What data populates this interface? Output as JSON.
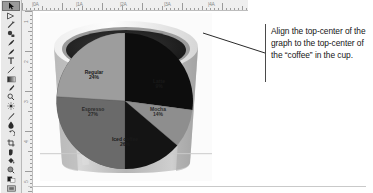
{
  "app": {
    "name": "image-editor",
    "canvas_background": "#ffffff"
  },
  "toolbar": {
    "name": "tools-palette",
    "selected_index": 0,
    "tools": [
      {
        "icon": "move-pointer-icon",
        "label": "Move"
      },
      {
        "icon": "lasso-icon",
        "label": "Lasso"
      },
      {
        "icon": "magic-wand-icon",
        "label": "Magic Wand"
      },
      {
        "icon": "stamp-icon",
        "label": "Clone Stamp"
      },
      {
        "icon": "brush-icon",
        "label": "Brush"
      },
      {
        "icon": "eraser-icon",
        "label": "Eraser"
      },
      {
        "icon": "text-icon",
        "label": "Type"
      },
      {
        "icon": "line-icon",
        "label": "Line"
      },
      {
        "icon": "gradient-icon",
        "label": "Gradient"
      },
      {
        "icon": "eyedropper-icon",
        "label": "Eyedropper"
      },
      {
        "icon": "zoom-icon",
        "label": "Zoom"
      },
      {
        "icon": "sun-icon",
        "label": "Dodge"
      },
      {
        "icon": "pen-icon",
        "label": "Pen"
      },
      {
        "icon": "blur-drop-icon",
        "label": "Blur"
      },
      {
        "icon": "undo-arrow-icon",
        "label": "Undo"
      },
      {
        "icon": "crop-icon",
        "label": "Crop"
      },
      {
        "icon": "hand-icon",
        "label": "Hand"
      },
      {
        "icon": "paint-bucket-icon",
        "label": "Paint Bucket"
      },
      {
        "icon": "search-circle-icon",
        "label": "Zoom Tool"
      },
      {
        "icon": "swatch-icon",
        "label": "Foreground Color"
      },
      {
        "icon": "screen-mode-icon",
        "label": "Screen Mode"
      }
    ]
  },
  "rulers": {
    "horizontal": {
      "name": "horizontal-ruler",
      "labels": [
        "|0A",
        "|1A",
        "|2A",
        "|3A",
        "|4A"
      ]
    },
    "vertical": {
      "name": "vertical-ruler",
      "labels": [
        "1",
        "2",
        "3",
        "4",
        "5"
      ]
    }
  },
  "document": {
    "name": "coffee-cup-document",
    "photo_alt": "coffee-cup-photo"
  },
  "chart_data": {
    "type": "pie",
    "title": "",
    "categories": [
      "Regular",
      "Latte",
      "Mocha",
      "Iced coffee",
      "Espresso"
    ],
    "values": [
      24,
      9,
      14,
      26,
      27
    ],
    "labels_shown": [
      {
        "name": "Regular",
        "pct": "24%",
        "tone": "light"
      },
      {
        "name": "Latte",
        "pct": "9%",
        "tone": "light"
      },
      {
        "name": "Mocha",
        "pct": "14%",
        "tone": "dark"
      },
      {
        "name": "Iced coffee",
        "pct": "26%",
        "tone": "light"
      },
      {
        "name": "Espresso",
        "pct": "27%",
        "tone": "dark"
      }
    ],
    "slice_colors": [
      "#9d9d9d",
      "#8e8e8e",
      "#141414",
      "#6a6a6a",
      "#0d0d0d"
    ],
    "legend": "none",
    "grid": false
  },
  "annotation": {
    "name": "instruction-callout",
    "text": "Align the top-center of the graph to the top-center of the “coffee” in the cup.",
    "leader_line_color": "#2a2a2a"
  }
}
